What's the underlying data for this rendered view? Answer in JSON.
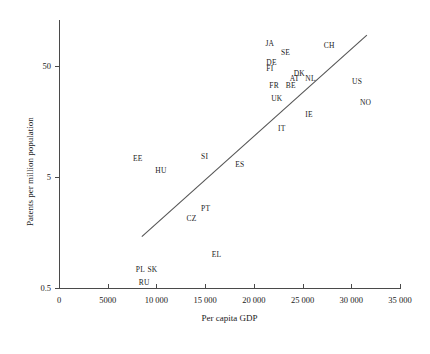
{
  "chart_data": {
    "type": "scatter",
    "title": "",
    "xlabel": "Per capita GDP",
    "ylabel": "Patents per million population",
    "xlim": [
      0,
      35000
    ],
    "ylim": [
      0.5,
      100
    ],
    "yscale": "log",
    "xscale": "linear",
    "grid": false,
    "legend": false,
    "xticks": [
      {
        "value": 0,
        "label": "0"
      },
      {
        "value": 5000,
        "label": "5000"
      },
      {
        "value": 10000,
        "label": "10 000"
      },
      {
        "value": 15000,
        "label": "15 000"
      },
      {
        "value": 20000,
        "label": "20 000"
      },
      {
        "value": 25000,
        "label": "25 000"
      },
      {
        "value": 30000,
        "label": "30 000"
      },
      {
        "value": 35000,
        "label": "35 000"
      }
    ],
    "yticks": [
      {
        "value": 50,
        "label": "50"
      },
      {
        "value": 5,
        "label": "5"
      },
      {
        "value": 0.5,
        "label": "0.5"
      }
    ],
    "points": [
      {
        "label": "JA",
        "x": 21800,
        "y": 79.0
      },
      {
        "label": "SE",
        "x": 23400,
        "y": 66.0
      },
      {
        "label": "CH",
        "x": 27800,
        "y": 76.0
      },
      {
        "label": "DE",
        "x": 21900,
        "y": 53.0
      },
      {
        "label": "FI",
        "x": 21900,
        "y": 47.0
      },
      {
        "label": "DK",
        "x": 24700,
        "y": 42.0
      },
      {
        "label": "NL",
        "x": 25900,
        "y": 38.0
      },
      {
        "label": "AT",
        "x": 24300,
        "y": 38.0
      },
      {
        "label": "US",
        "x": 30700,
        "y": 36.0
      },
      {
        "label": "FR",
        "x": 22200,
        "y": 33.0
      },
      {
        "label": "BE",
        "x": 23900,
        "y": 33.0
      },
      {
        "label": "UK",
        "x": 22400,
        "y": 25.0
      },
      {
        "label": "NO",
        "x": 31500,
        "y": 23.0
      },
      {
        "label": "IE",
        "x": 25900,
        "y": 18.0
      },
      {
        "label": "IT",
        "x": 23100,
        "y": 13.5
      },
      {
        "label": "SI",
        "x": 15200,
        "y": 7.6
      },
      {
        "label": "ES",
        "x": 18700,
        "y": 6.4
      },
      {
        "label": "EE",
        "x": 8200,
        "y": 7.2
      },
      {
        "label": "HU",
        "x": 10500,
        "y": 5.7
      },
      {
        "label": "PT",
        "x": 15200,
        "y": 2.6
      },
      {
        "label": "CZ",
        "x": 13700,
        "y": 2.1
      },
      {
        "label": "EL",
        "x": 16300,
        "y": 1.0
      },
      {
        "label": "PL",
        "x": 8500,
        "y": 0.72
      },
      {
        "label": "SK",
        "x": 9700,
        "y": 0.72
      },
      {
        "label": "RU",
        "x": 8800,
        "y": 0.56
      }
    ],
    "trendline": {
      "name": "regression-line",
      "x1": 8500,
      "y1": 1.45,
      "x2": 31600,
      "y2": 95.0
    },
    "colors": {
      "axis": "#4a4a4a",
      "text": "#1a1a1a",
      "line": "#555555"
    }
  }
}
